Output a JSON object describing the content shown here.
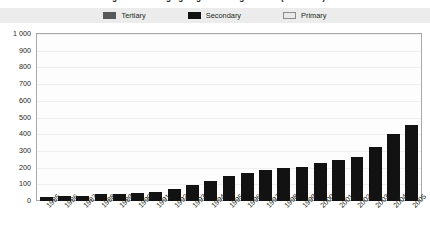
{
  "chart_data": {
    "type": "bar",
    "title": "Figure 1.1 Changing origins of UK graduates (1985-2005)",
    "subtitle": "",
    "xlabel": "",
    "ylabel": "",
    "ylim": [
      0,
      1000
    ],
    "ytick_labels": [
      "1 000",
      "900",
      "800",
      "700",
      "600",
      "500",
      "400",
      "300",
      "200",
      "100",
      "0"
    ],
    "ytick_values": [
      1000,
      900,
      800,
      700,
      600,
      500,
      400,
      300,
      200,
      100,
      0
    ],
    "grid": true,
    "legend_position": "top",
    "categories": [
      "1985",
      "1986",
      "1987",
      "1988",
      "1989",
      "1990",
      "1991",
      "1992",
      "1993",
      "1994",
      "1995",
      "1996",
      "1997",
      "1998",
      "1999",
      "2000",
      "2001",
      "2002",
      "2003",
      "2004",
      "2005"
    ],
    "series": [
      {
        "name": "Tertiary",
        "color": "#58595b",
        "values": [
          0,
          0,
          0,
          0,
          0,
          0,
          0,
          0,
          0,
          0,
          0,
          0,
          0,
          0,
          0,
          0,
          0,
          0,
          0,
          0,
          0
        ]
      },
      {
        "name": "Secondary",
        "color": "#121212",
        "values": [
          25,
          28,
          32,
          42,
          45,
          48,
          55,
          70,
          95,
          120,
          150,
          168,
          185,
          195,
          205,
          225,
          248,
          265,
          325,
          400,
          455
        ]
      },
      {
        "name": "Primary",
        "color": "#e9e9e9",
        "values": [
          0,
          0,
          0,
          0,
          0,
          0,
          0,
          0,
          0,
          0,
          0,
          0,
          0,
          0,
          0,
          0,
          0,
          0,
          0,
          0,
          0
        ]
      }
    ]
  },
  "legend": {
    "items": [
      {
        "label": "Tertiary",
        "swatch_class": "sw-tertiary",
        "name": "legend-swatch-tertiary"
      },
      {
        "label": "Secondary",
        "swatch_class": "sw-secondary",
        "name": "legend-swatch-secondary"
      },
      {
        "label": "Primary",
        "swatch_class": "sw-primary",
        "name": "legend-swatch-primary"
      }
    ]
  },
  "colors": {
    "tertiary": "#58595b",
    "secondary": "#121212",
    "primary": "#e9e9e9",
    "legend_background": "#ececec",
    "plot_background": "#fdfdfd",
    "frame_border": "#a9a9a9",
    "gridline": "#efefef",
    "text": "#231f20"
  }
}
